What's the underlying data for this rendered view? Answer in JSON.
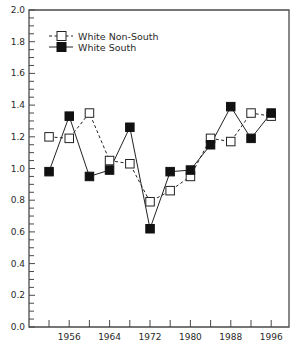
{
  "chart_data": {
    "type": "line",
    "title": "",
    "xlabel": "",
    "ylabel": "",
    "x": [
      1952,
      1956,
      1960,
      1964,
      1968,
      1972,
      1976,
      1980,
      1984,
      1988,
      1992,
      1996
    ],
    "x_tick_labels": [
      "1956",
      "1964",
      "1972",
      "1980",
      "1988",
      "1996"
    ],
    "y_tick_labels": [
      "0.0",
      "0.2",
      "0.4",
      "0.6",
      "0.8",
      "1.0",
      "1.2",
      "1.4",
      "1.6",
      "1.8",
      "2.0"
    ],
    "ylim": [
      0,
      2.0
    ],
    "xlim": [
      1948,
      2000
    ],
    "grid": false,
    "legend_position": "upper-left",
    "series": [
      {
        "name": "White Non-South",
        "style": "dashed",
        "marker": "open-square",
        "values": [
          1.2,
          1.19,
          1.35,
          1.05,
          1.03,
          0.79,
          0.86,
          0.95,
          1.19,
          1.17,
          1.35,
          1.33
        ]
      },
      {
        "name": "White South",
        "style": "solid",
        "marker": "filled-square",
        "values": [
          0.98,
          1.33,
          0.95,
          0.99,
          1.26,
          0.62,
          0.98,
          0.99,
          1.15,
          1.39,
          1.19,
          1.35
        ]
      }
    ]
  },
  "legend": {
    "items": [
      {
        "label": "White Non-South"
      },
      {
        "label": "White South"
      }
    ]
  },
  "colors": {
    "axis": "#4a4a4a",
    "line": "#222222",
    "marker_fill_open": "#ffffff",
    "marker_fill_solid": "#111111",
    "text": "#2a2a2a"
  }
}
